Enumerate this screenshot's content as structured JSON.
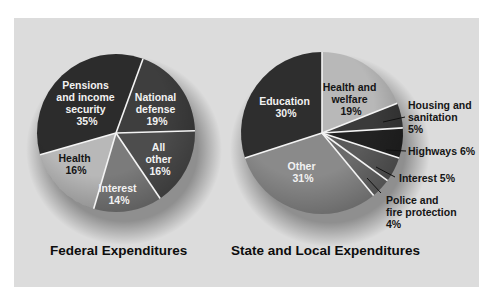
{
  "chart_data": [
    {
      "type": "pie",
      "title": "Federal Expenditures",
      "start_angle_deg": 20,
      "direction": "clockwise",
      "slices": [
        {
          "label": "National defense",
          "value": 19,
          "color": "#3e3e3e"
        },
        {
          "label": "All other",
          "value": 16,
          "color": "#4d4d4d"
        },
        {
          "label": "Interest",
          "value": 14,
          "color": "#7b7b7b"
        },
        {
          "label": "Health",
          "value": 16,
          "color": "#b8b8b8"
        },
        {
          "label": "Pensions and income security",
          "value": 35,
          "color": "#2c2c2c"
        }
      ],
      "unit": "%"
    },
    {
      "type": "pie",
      "title": "State and Local Expenditures",
      "start_angle_deg": 0,
      "direction": "clockwise",
      "slices": [
        {
          "label": "Health and welfare",
          "value": 19,
          "color": "#b8b8b8"
        },
        {
          "label": "Housing and sanitation",
          "value": 5,
          "color": "#3a3a3a"
        },
        {
          "label": "Highways",
          "value": 6,
          "color": "#222222"
        },
        {
          "label": "Interest",
          "value": 5,
          "color": "#5a5a5a"
        },
        {
          "label": "Police and fire protection",
          "value": 4,
          "color": "#6a6a6a"
        },
        {
          "label": "Other",
          "value": 31,
          "color": "#8a8a8a"
        },
        {
          "label": "Education",
          "value": 30,
          "color": "#2e2e2e"
        }
      ],
      "unit": "%"
    }
  ],
  "federal": {
    "title": "Federal Expenditures",
    "labels": {
      "pensions": [
        "Pensions",
        "and income",
        "security",
        "35%"
      ],
      "defense": [
        "National",
        "defense",
        "19%"
      ],
      "other": [
        "All",
        "other",
        "16%"
      ],
      "interest": [
        "Interest",
        "14%"
      ],
      "health": [
        "Health",
        "16%"
      ]
    }
  },
  "state": {
    "title": "State and Local Expenditures",
    "labels": {
      "health_welfare": [
        "Health and",
        "welfare",
        "19%"
      ],
      "education": [
        "Education",
        "30%"
      ],
      "other": [
        "Other",
        "31%"
      ],
      "housing": [
        "Housing and",
        "sanitation",
        "5%"
      ],
      "highways": [
        "Highways 6%"
      ],
      "interest": [
        "Interest 5%"
      ],
      "police": [
        "Police and",
        "fire protection",
        "4%"
      ]
    }
  }
}
